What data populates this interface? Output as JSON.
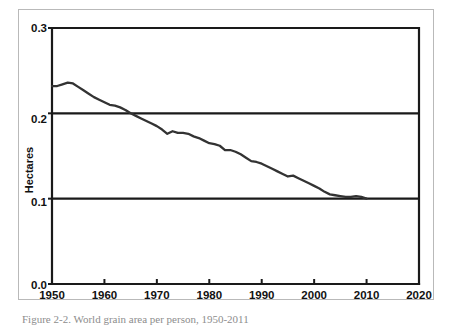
{
  "figure": {
    "caption": "Figure 2-2. World grain area per person, 1950-2011"
  },
  "chart_data": {
    "type": "line",
    "title": "",
    "subtitle": "",
    "xlabel": "",
    "ylabel": "Hectares",
    "xlim": [
      1950,
      2020
    ],
    "ylim": [
      0.0,
      0.3
    ],
    "xticks": [
      1950,
      1960,
      1970,
      1980,
      1990,
      2000,
      2010,
      2020
    ],
    "xtick_labels": [
      "1950",
      "1960",
      "1970",
      "1980",
      "1990",
      "2000",
      "2010",
      "2020"
    ],
    "yticks": [
      0.0,
      0.1,
      0.2,
      0.3
    ],
    "ytick_labels": [
      "0.0",
      "0.1",
      "0.2",
      "0.3"
    ],
    "grid": "horizontal-at-0.1-and-0.2",
    "legend": "none",
    "line_color": "#333333",
    "series": [
      {
        "name": "World grain area per person",
        "x": [
          1950,
          1951,
          1952,
          1953,
          1954,
          1955,
          1956,
          1957,
          1958,
          1959,
          1960,
          1961,
          1962,
          1963,
          1964,
          1965,
          1966,
          1967,
          1968,
          1969,
          1970,
          1971,
          1972,
          1973,
          1974,
          1975,
          1976,
          1977,
          1978,
          1979,
          1980,
          1981,
          1982,
          1983,
          1984,
          1985,
          1986,
          1987,
          1988,
          1989,
          1990,
          1991,
          1992,
          1993,
          1994,
          1995,
          1996,
          1997,
          1998,
          1999,
          2000,
          2001,
          2002,
          2003,
          2004,
          2005,
          2006,
          2007,
          2008,
          2009,
          2010
        ],
        "values": [
          0.232,
          0.232,
          0.234,
          0.236,
          0.235,
          0.231,
          0.227,
          0.223,
          0.219,
          0.216,
          0.213,
          0.21,
          0.209,
          0.207,
          0.204,
          0.2,
          0.197,
          0.194,
          0.191,
          0.188,
          0.185,
          0.181,
          0.176,
          0.179,
          0.177,
          0.177,
          0.176,
          0.173,
          0.171,
          0.168,
          0.165,
          0.164,
          0.162,
          0.157,
          0.157,
          0.155,
          0.152,
          0.148,
          0.144,
          0.143,
          0.141,
          0.138,
          0.135,
          0.132,
          0.129,
          0.126,
          0.127,
          0.124,
          0.121,
          0.118,
          0.115,
          0.112,
          0.108,
          0.105,
          0.104,
          0.103,
          0.102,
          0.102,
          0.103,
          0.102,
          0.1
        ]
      }
    ]
  },
  "axis": {
    "y_title": "Hectares"
  }
}
